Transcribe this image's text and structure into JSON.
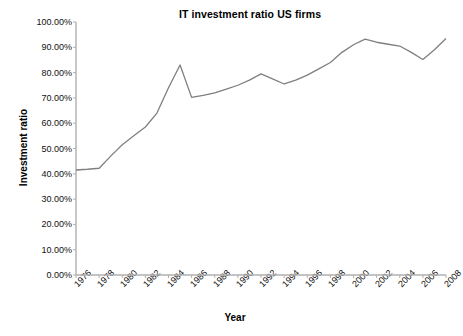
{
  "chart_data": {
    "type": "line",
    "title": "IT investment ratio US firms",
    "xlabel": "Year",
    "ylabel": "Investment ratio",
    "grid": false,
    "legend": "none",
    "line_color": "#7f7f7f",
    "xlim": [
      1976,
      2008
    ],
    "ylim": [
      0,
      100
    ],
    "ytick_labels": [
      "100.00%",
      "90.00%",
      "80.00%",
      "70.00%",
      "60.00%",
      "50.00%",
      "40.00%",
      "30.00%",
      "20.00%",
      "10.00%",
      "0.00%"
    ],
    "ytick_values": [
      100,
      90,
      80,
      70,
      60,
      50,
      40,
      30,
      20,
      10,
      0
    ],
    "xtick_labels": [
      "1976",
      "1978",
      "1980",
      "1982",
      "1984",
      "1986",
      "1988",
      "1990",
      "1992",
      "1994",
      "1996",
      "1998",
      "2000",
      "2002",
      "2004",
      "2006",
      "2008"
    ],
    "xtick_values": [
      1976,
      1978,
      1980,
      1982,
      1984,
      1986,
      1988,
      1990,
      1992,
      1994,
      1996,
      1998,
      2000,
      2002,
      2004,
      2006,
      2008
    ],
    "x": [
      1976,
      1977,
      1978,
      1979,
      1980,
      1981,
      1982,
      1983,
      1984,
      1985,
      1986,
      1987,
      1988,
      1989,
      1990,
      1991,
      1992,
      1993,
      1994,
      1995,
      1996,
      1997,
      1998,
      1999,
      2000,
      2001,
      2002,
      2003,
      2004,
      2005,
      2006,
      2007,
      2008
    ],
    "values": [
      41.5,
      41.8,
      42.2,
      47.0,
      51.5,
      55.0,
      58.5,
      64.0,
      74.0,
      83.0,
      70.2,
      71.0,
      72.0,
      73.5,
      75.0,
      77.0,
      79.5,
      77.5,
      75.5,
      77.0,
      79.0,
      81.5,
      84.0,
      88.0,
      91.0,
      93.2,
      92.0,
      91.2,
      90.5,
      88.0,
      85.2,
      89.0,
      93.5
    ],
    "unit": "%"
  }
}
